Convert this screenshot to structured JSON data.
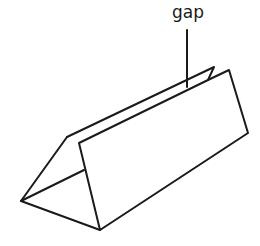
{
  "diagram": {
    "label": "gap",
    "stroke_color": "#1a1a1a",
    "background": "#ffffff"
  }
}
